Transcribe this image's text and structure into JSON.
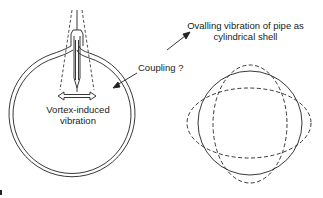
{
  "labels": {
    "vortex_line1": "Vortex-induced",
    "vortex_line2": "vibration",
    "coupling": "Coupling ?",
    "ovalling_line1": "Ovalling vibration of pipe as",
    "ovalling_line2": "cylindrical shell"
  },
  "colors": {
    "stroke": "#222222",
    "background": "#ffffff"
  }
}
